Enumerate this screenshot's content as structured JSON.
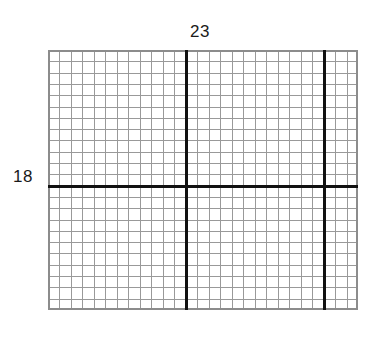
{
  "figure": {
    "type": "area-model-grid",
    "background_color": "#ffffff",
    "labels": {
      "top": "23",
      "left": "18"
    },
    "grid": {
      "origin_x": 48,
      "origin_y": 50,
      "width_px": 310,
      "height_px": 260,
      "columns": 27,
      "rows": 23,
      "cell_width_px": 11.481,
      "cell_height_px": 11.304,
      "minor_line_color": "#999999",
      "minor_line_width": 1,
      "border_color": "#8c8c8c",
      "border_width": 2,
      "bold_line_color": "#111111",
      "bold_line_width": 3.2
    },
    "bold_dividers": {
      "vertical_columns": [
        12,
        24
      ],
      "horizontal_rows": [
        12
      ]
    },
    "regions": [
      {
        "name": "top-left",
        "cols": 12,
        "rows": 12
      },
      {
        "name": "top-middle",
        "cols": 12,
        "rows": 12
      },
      {
        "name": "top-right",
        "cols": 3,
        "rows": 12
      },
      {
        "name": "bottom-left",
        "cols": 12,
        "rows": 11
      },
      {
        "name": "bottom-middle",
        "cols": 12,
        "rows": 11
      },
      {
        "name": "bottom-right",
        "cols": 3,
        "rows": 11
      }
    ]
  },
  "chart_data": {
    "type": "table",
    "title": "",
    "xlabel": "23",
    "ylabel": "18",
    "categories": [
      "width",
      "height"
    ],
    "values": [
      23,
      18
    ],
    "grid": true
  }
}
